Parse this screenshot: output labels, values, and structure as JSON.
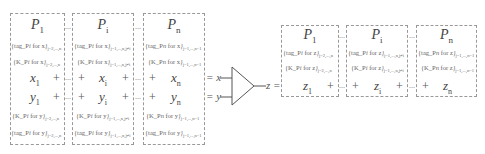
{
  "left_boxes": [
    {
      "title": "P",
      "title_sub": "1",
      "tag_x": "{tag_P",
      "tag_x2": " for x",
      "tag_x_sub": "j=2,...,n",
      "k_x": "{K_P",
      "k_x2": " for x",
      "k_x_sub": "j=2,...,n",
      "x": "x",
      "x_sub": "1",
      "y": "y",
      "y_sub": "1",
      "k_y": "{K_P",
      "k_y2": " for y",
      "k_y_sub": "j=2,...,n",
      "tag_y": "{tag_P",
      "tag_y2": " for y",
      "tag_y_sub": "j=2,...,n"
    },
    {
      "title": "P",
      "title_sub": "i",
      "tag_x": "{tag_P",
      "tag_x2": " for x",
      "tag_x_sub": "j=1,...,n,j≠i",
      "k_x": "{K_P",
      "k_x2": " for x",
      "k_x_sub": "j=1,...,n,j≠i",
      "x": "x",
      "x_sub": "i",
      "y": "y",
      "y_sub": "i",
      "k_y": "{K_P",
      "k_y2": " for y",
      "k_y_sub": "j=1,...,n,j≠i",
      "tag_y": "{tag_P",
      "tag_y2": " for y",
      "tag_y_sub": "j=1,...,n,j≠i"
    },
    {
      "title": "P",
      "title_sub": "n",
      "tag_x": "{tag_P",
      "tag_x2": " for x",
      "tag_x_sub": "j=1,...,n−1",
      "k_x": "{K_P",
      "k_x2": " for x",
      "k_x_sub": "j=1,...,n−1",
      "x": "x",
      "x_sub": "n",
      "y": "y",
      "y_sub": "n",
      "k_y": "{K_P",
      "k_y2": " for y",
      "k_y_sub": "j=1,...,n−1",
      "tag_y": "{tag_P",
      "tag_y2": " for y",
      "tag_y_sub": "j=1,...,n−1"
    }
  ],
  "right_boxes": [
    {
      "title": "P",
      "title_sub": "1",
      "tag_z": "{tag_P",
      "tag_z2": " for z",
      "tag_z_sub": "j=2,...,n",
      "k_z": "{K_P",
      "k_z2": " for z",
      "k_z_sub": "j=2,...,n",
      "z": "z",
      "z_sub": "1"
    },
    {
      "title": "P",
      "title_sub": "i",
      "tag_z": "{tag_P",
      "tag_z2": " for z",
      "tag_z_sub": "j=1,...,n,j≠i",
      "k_z": "{K_P",
      "k_z2": " for z",
      "k_z_sub": "j=1,...,n,j≠i",
      "z": "z",
      "z_sub": "i"
    },
    {
      "title": "P",
      "title_sub": "n",
      "tag_z": "{tag_P",
      "tag_z2": " for z",
      "tag_z_sub": "j=1,...,n−1",
      "k_z": "{K_P",
      "k_z2": " for z",
      "k_z_sub": "j=1,...,n−1",
      "z": "z",
      "z_sub": "n"
    }
  ],
  "symbols": {
    "plus": "+",
    "dots": "...",
    "eq_x": "= x",
    "eq_y": "= y",
    "z_eq": "z ="
  }
}
